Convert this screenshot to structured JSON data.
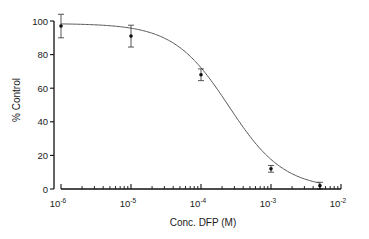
{
  "chart_data": {
    "type": "scatter",
    "title": "",
    "xlabel": "Conc. DFP (M)",
    "ylabel": "% Control",
    "xscale": "log",
    "xlim": [
      1e-06,
      0.01
    ],
    "ylim": [
      0,
      100
    ],
    "grid": false,
    "legend": null,
    "x_tick_labels": [
      {
        "base": "10",
        "exp": "-6",
        "value": 1e-06
      },
      {
        "base": "10",
        "exp": "-5",
        "value": 1e-05
      },
      {
        "base": "10",
        "exp": "-4",
        "value": 0.0001
      },
      {
        "base": "10",
        "exp": "-3",
        "value": 0.001
      },
      {
        "base": "10",
        "exp": "-2",
        "value": 0.01
      }
    ],
    "y_tick_labels": [
      "0",
      "20",
      "40",
      "60",
      "80",
      "100"
    ],
    "y_ticks": [
      0,
      20,
      40,
      60,
      80,
      100
    ],
    "series": [
      {
        "name": "DFP",
        "points": [
          {
            "x": 1e-06,
            "y": 97,
            "err": 7
          },
          {
            "x": 1e-05,
            "y": 91,
            "err": 6.5
          },
          {
            "x": 0.0001,
            "y": 68,
            "err": 3.5
          },
          {
            "x": 0.001,
            "y": 12,
            "err": 2
          },
          {
            "x": 0.005,
            "y": 2,
            "err": 2
          }
        ],
        "fit": {
          "type": "sigmoid",
          "top": 98.5,
          "bottom": 0,
          "ic50": 0.00025,
          "hill": 1.1
        }
      }
    ]
  }
}
